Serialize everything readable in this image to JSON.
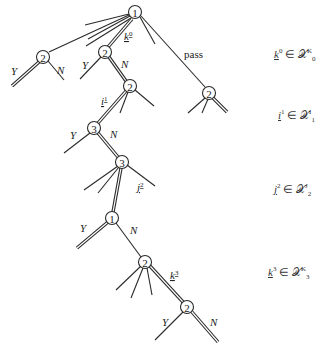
{
  "diagram": {
    "type": "game-tree",
    "nodes": [
      {
        "id": "root",
        "player": "1"
      },
      {
        "id": "left",
        "player": "2"
      },
      {
        "id": "k0node",
        "player": "2"
      },
      {
        "id": "pass",
        "player": "2"
      },
      {
        "id": "i1node",
        "player": "2"
      },
      {
        "id": "n3a",
        "player": "3"
      },
      {
        "id": "n3b",
        "player": "3"
      },
      {
        "id": "n1",
        "player": "1"
      },
      {
        "id": "n2a",
        "player": "2"
      },
      {
        "id": "n2b",
        "player": "2"
      }
    ],
    "edge_labels": {
      "left_y": "Y",
      "left_n": "N",
      "k0_y": "Y",
      "k0_n": "N",
      "pass": "pass",
      "k0": "k",
      "k0_sup": "0",
      "i1": "i",
      "i1_sup": "1",
      "n3a_y": "Y",
      "n3a_n": "N",
      "j2": "j",
      "j2_sup": "2",
      "n1_y": "Y",
      "n1_n": "N",
      "k3": "k",
      "k3_sup": "3",
      "n2b_y": "Y",
      "n2b_n": "N"
    },
    "side_labels": [
      {
        "var": "k",
        "sup": "0",
        "rel": " ∈ ",
        "set": "𝒳",
        "set_sup": "K",
        "set_sub": "0"
      },
      {
        "var": "i",
        "sup": "1",
        "rel": " ∈ ",
        "set": "𝒳",
        "set_sup": "I",
        "set_sub": "1"
      },
      {
        "var": "j",
        "sup": "2",
        "rel": " ∈ ",
        "set": "𝒳",
        "set_sup": "J",
        "set_sub": "2"
      },
      {
        "var": "k",
        "sup": "3",
        "rel": " ∈ ",
        "set": "𝒳",
        "set_sup": "K",
        "set_sub": "3"
      }
    ]
  }
}
